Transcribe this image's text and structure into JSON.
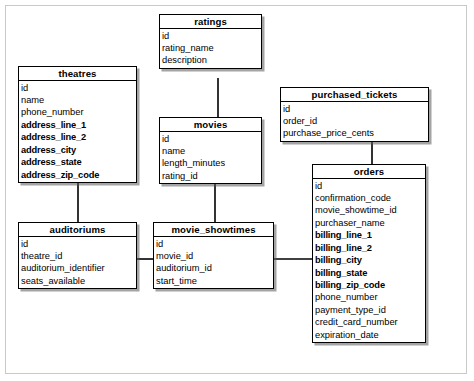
{
  "diagram": {
    "kind": "entity-relationship-diagram",
    "entities": [
      {
        "id": "ratings",
        "name": "ratings",
        "x": 159,
        "y": 14,
        "w": 103,
        "columns": [
          {
            "name": "id",
            "bold": false
          },
          {
            "name": "rating_name",
            "bold": false
          },
          {
            "name": "description",
            "bold": false
          }
        ]
      },
      {
        "id": "theatres",
        "name": "theatres",
        "x": 18,
        "y": 66,
        "w": 119,
        "columns": [
          {
            "name": "id",
            "bold": false
          },
          {
            "name": "name",
            "bold": false
          },
          {
            "name": "phone_number",
            "bold": false
          },
          {
            "name": "address_line_1",
            "bold": true
          },
          {
            "name": "address_line_2",
            "bold": true
          },
          {
            "name": "address_city",
            "bold": true
          },
          {
            "name": "address_state",
            "bold": true
          },
          {
            "name": "address_zip_code",
            "bold": true
          }
        ]
      },
      {
        "id": "purchased_tickets",
        "name": "purchased_tickets",
        "x": 280,
        "y": 87,
        "w": 149,
        "columns": [
          {
            "name": "id",
            "bold": false
          },
          {
            "name": "order_id",
            "bold": false
          },
          {
            "name": "purchase_price_cents",
            "bold": false
          }
        ]
      },
      {
        "id": "movies",
        "name": "movies",
        "x": 159,
        "y": 117,
        "w": 103,
        "columns": [
          {
            "name": "id",
            "bold": false
          },
          {
            "name": "name",
            "bold": false
          },
          {
            "name": "length_minutes",
            "bold": false
          },
          {
            "name": "rating_id",
            "bold": false
          }
        ]
      },
      {
        "id": "orders",
        "name": "orders",
        "x": 312,
        "y": 164,
        "w": 114,
        "columns": [
          {
            "name": "id",
            "bold": false
          },
          {
            "name": "confirmation_code",
            "bold": false
          },
          {
            "name": "movie_showtime_id",
            "bold": false
          },
          {
            "name": "purchaser_name",
            "bold": false
          },
          {
            "name": "billing_line_1",
            "bold": true
          },
          {
            "name": "billing_line_2",
            "bold": true
          },
          {
            "name": "billing_city",
            "bold": true
          },
          {
            "name": "billing_state",
            "bold": true
          },
          {
            "name": "billing_zip_code",
            "bold": true
          },
          {
            "name": "phone_number",
            "bold": false
          },
          {
            "name": "payment_type_id",
            "bold": false
          },
          {
            "name": "credit_card_number",
            "bold": false
          },
          {
            "name": "expiration_date",
            "bold": false
          }
        ]
      },
      {
        "id": "auditoriums",
        "name": "auditoriums",
        "x": 18,
        "y": 222,
        "w": 119,
        "columns": [
          {
            "name": "id",
            "bold": false
          },
          {
            "name": "theatre_id",
            "bold": false
          },
          {
            "name": "auditorium_identifier",
            "bold": false
          },
          {
            "name": "seats_available",
            "bold": false
          }
        ]
      },
      {
        "id": "movie_showtimes",
        "name": "movie_showtimes",
        "x": 153,
        "y": 222,
        "w": 121,
        "columns": [
          {
            "name": "id",
            "bold": false
          },
          {
            "name": "movie_id",
            "bold": false
          },
          {
            "name": "auditorium_id",
            "bold": false
          },
          {
            "name": "start_time",
            "bold": false
          }
        ]
      }
    ],
    "relationships": [
      {
        "from": "ratings",
        "to": "movies",
        "path": "M 218 78 L 218 117"
      },
      {
        "from": "theatres",
        "to": "auditoriums",
        "path": "M 78 183 L 78 222"
      },
      {
        "from": "purchased_tickets",
        "to": "orders",
        "path": "M 372 138 L 372 164"
      },
      {
        "from": "movies",
        "to": "movie_showtimes",
        "path": "M 215 180 L 215 222"
      },
      {
        "from": "auditoriums",
        "to": "movie_showtimes",
        "path": "M 137 259 L 153 259"
      },
      {
        "from": "movie_showtimes",
        "to": "orders",
        "path": "M 274 259 L 312 259"
      }
    ],
    "colors": {
      "entity_border": "#000000",
      "entity_fill": "#ffffff",
      "shadow": "#5a5a5a",
      "frame_border": "#c9c9c9",
      "line": "#000000"
    }
  }
}
